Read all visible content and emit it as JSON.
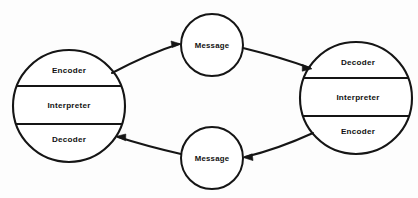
{
  "diagram": {
    "background_color": "#fdfdfd",
    "ink_color": "#151515",
    "nodes": {
      "left_party": {
        "name": "left-communicator",
        "segments": [
          {
            "label": "Encoder"
          },
          {
            "label": "Interpreter"
          },
          {
            "label": "Decoder"
          }
        ]
      },
      "right_party": {
        "name": "right-communicator",
        "segments": [
          {
            "label": "Decoder"
          },
          {
            "label": "Interpreter"
          },
          {
            "label": "Encoder"
          }
        ]
      },
      "top_message": {
        "label": "Message"
      },
      "bottom_message": {
        "label": "Message"
      }
    },
    "flows": [
      {
        "name": "left-to-top-message",
        "direction": "right"
      },
      {
        "name": "top-message-to-right",
        "direction": "right"
      },
      {
        "name": "right-to-bottom-message",
        "direction": "left"
      },
      {
        "name": "bottom-message-to-left",
        "direction": "left"
      }
    ]
  }
}
